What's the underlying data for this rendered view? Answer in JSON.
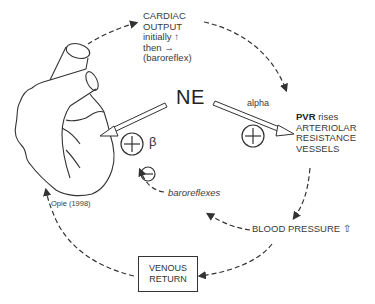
{
  "diagram": {
    "center_label": "NE",
    "cardiac_output": {
      "line1": "CARDIAC",
      "line2": "OUTPUT",
      "line3": "initially ↑",
      "line4": "then →",
      "line5": "(baroreflex)"
    },
    "alpha_label": "alpha",
    "beta_label": "β",
    "pvr": {
      "bold": "PVR",
      "rest": " rises",
      "line2": "ARTERIOLAR",
      "line3": "RESISTANCE",
      "line4": "VESSELS"
    },
    "baroreflexes_label": "baroreflexes",
    "blood_pressure_label": "BLOOD PRESSURE ⇧",
    "venous_return": {
      "line1": "VENOUS",
      "line2": "RETURN"
    },
    "citation": "Opie (1998)",
    "symbols": {
      "plus": "+",
      "minus": "−"
    },
    "colors": {
      "line": "#333333",
      "background": "#ffffff"
    }
  }
}
